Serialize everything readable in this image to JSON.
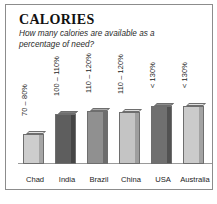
{
  "card": {
    "title": "CALORIES",
    "subtitle": "How many calories are available as a percentage of need?"
  },
  "chart_data": {
    "type": "bar",
    "title": "CALORIES",
    "subtitle": "How many calories are available as a percentage of need?",
    "xlabel": "",
    "ylabel": "",
    "grid": false,
    "legend": false,
    "ylim": [
      0,
      130
    ],
    "categories": [
      "Chad",
      "India",
      "Brazil",
      "China",
      "USA",
      "Australia"
    ],
    "values": [
      75,
      105,
      115,
      115,
      130,
      130
    ],
    "value_labels": [
      "70 – 80%",
      "100 – 110%",
      "110 – 120%",
      "110 – 120%",
      "< 130%",
      "< 130%"
    ],
    "bar_colors": [
      "#c9c9c9",
      "#5c5c5c",
      "#8e8e8e",
      "#c2c2c2",
      "#6e6e6e",
      "#c9c9c9"
    ],
    "bars": [
      {
        "category": "Chad",
        "label": "70 – 80%",
        "value": 75,
        "height_px": 30,
        "front_color": "#cdcdcd",
        "side_color": "#a6a6a6",
        "top_color": "#e2e2e2"
      },
      {
        "category": "India",
        "label": "100 – 110%",
        "value": 105,
        "height_px": 50,
        "front_color": "#5e5e5e",
        "side_color": "#454545",
        "top_color": "#7b7b7b"
      },
      {
        "category": "Brazil",
        "label": "110 – 120%",
        "value": 115,
        "height_px": 53,
        "front_color": "#909090",
        "side_color": "#6d6d6d",
        "top_color": "#a9a9a9"
      },
      {
        "category": "China",
        "label": "110 – 120%",
        "value": 115,
        "height_px": 52,
        "front_color": "#c4c4c4",
        "side_color": "#9e9e9e",
        "top_color": "#dcdcdc"
      },
      {
        "category": "USA",
        "label": "< 130%",
        "value": 130,
        "height_px": 58,
        "front_color": "#707070",
        "side_color": "#525252",
        "top_color": "#8c8c8c"
      },
      {
        "category": "Australia",
        "label": "< 130%",
        "value": 130,
        "height_px": 58,
        "front_color": "#cbcbcb",
        "side_color": "#a3a3a3",
        "top_color": "#e0e0e0"
      }
    ]
  }
}
